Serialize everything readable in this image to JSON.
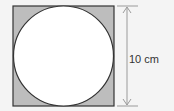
{
  "diagram": {
    "dimension_label": "10 cm",
    "colors": {
      "background": "#f4f4f4",
      "square_fill": "#bdbdbd",
      "circle_fill": "#ffffff",
      "outline": "#333333",
      "dimension_line": "#9a9a9a"
    }
  }
}
